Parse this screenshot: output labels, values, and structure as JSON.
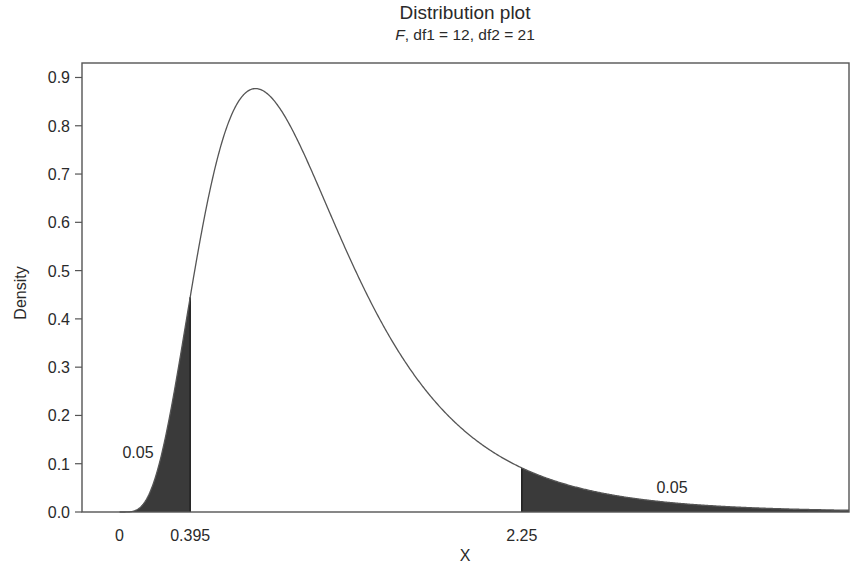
{
  "chart_data": {
    "type": "area",
    "title": "Distribution plot",
    "subtitle": {
      "dist": "F",
      "params": ", df1 = 12, df2 = 21"
    },
    "distribution": {
      "name": "F",
      "df1": 12,
      "df2": 21
    },
    "xlabel": "X",
    "ylabel": "Density",
    "xlim": [
      -0.21,
      4.08
    ],
    "ylim": [
      0.0,
      0.93
    ],
    "grid": false,
    "legend": null,
    "y_ticks": [
      0.0,
      0.1,
      0.2,
      0.3,
      0.4,
      0.5,
      0.6,
      0.7,
      0.8,
      0.9
    ],
    "y_tick_labels": [
      "0.0",
      "0.1",
      "0.2",
      "0.3",
      "0.4",
      "0.5",
      "0.6",
      "0.7",
      "0.8",
      "0.9"
    ],
    "x_tick_labels": [
      {
        "value": 0,
        "label": "0"
      },
      {
        "value": 0.395,
        "label": "0.395"
      },
      {
        "value": 2.25,
        "label": "2.25"
      }
    ],
    "curve": {
      "x": [
        0.0,
        0.2,
        0.3,
        0.395,
        0.5,
        0.6,
        0.76,
        1.0,
        1.25,
        1.5,
        1.75,
        2.0,
        2.25,
        2.5,
        3.0,
        3.5,
        4.0
      ],
      "y": [
        0.0,
        0.07,
        0.22,
        0.447,
        0.66,
        0.8,
        0.875,
        0.78,
        0.58,
        0.39,
        0.24,
        0.145,
        0.088,
        0.052,
        0.018,
        0.006,
        0.002
      ]
    },
    "peak": {
      "x": 0.76,
      "y": 0.875
    },
    "shaded_regions": [
      {
        "name": "lower-tail",
        "from": 0.0,
        "to": 0.395,
        "area": 0.05,
        "label": "0.05"
      },
      {
        "name": "upper-tail",
        "from": 2.25,
        "to": 4.08,
        "area": 0.05,
        "label": "0.05"
      }
    ],
    "annotations": [
      {
        "text": "0.05",
        "x_px": 138,
        "y_px": 452
      },
      {
        "text": "0.05",
        "x_px": 672,
        "y_px": 487
      }
    ]
  },
  "colors": {
    "curve": "#555555",
    "fill": "#3a3a3a",
    "axis": "#555555",
    "text": "#2a2a2a"
  }
}
